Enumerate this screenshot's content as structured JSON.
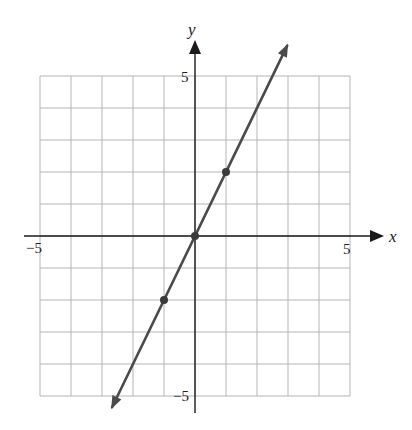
{
  "chart_data": {
    "type": "line",
    "title": "",
    "xlabel": "x",
    "ylabel": "y",
    "xlim": [
      -5,
      5
    ],
    "ylim": [
      -5,
      5
    ],
    "grid": true,
    "grid_step": 1,
    "tick_labels": {
      "x": [
        {
          "value": -5,
          "label": "−5"
        },
        {
          "value": 5,
          "label": "5"
        }
      ],
      "y": [
        {
          "value": 5,
          "label": "5"
        },
        {
          "value": -5,
          "label": "−5"
        }
      ]
    },
    "series": [
      {
        "name": "y = 2x",
        "equation": "y = 2x",
        "slope": 2,
        "intercept": 0,
        "line_extends_both_directions": true,
        "marked_points": [
          {
            "x": -1,
            "y": -2
          },
          {
            "x": 0,
            "y": 0
          },
          {
            "x": 1,
            "y": 2
          }
        ],
        "color": "#4a4a4a"
      }
    ],
    "legend": null
  },
  "colors": {
    "grid": "#b5b5b5",
    "axis": "#1a1a1a",
    "line": "#4a4a4a",
    "point": "#3a3a3a"
  }
}
